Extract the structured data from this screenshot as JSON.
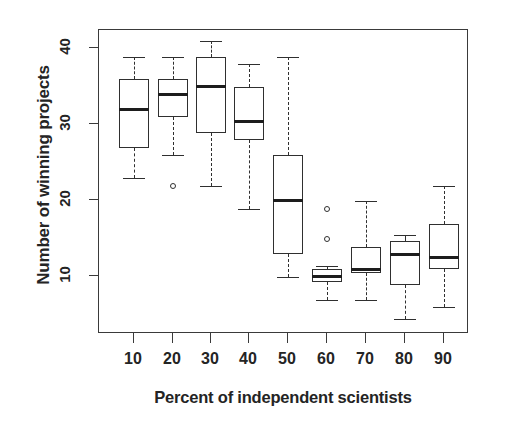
{
  "chart_data": {
    "type": "box",
    "title": "",
    "xlabel": "Percent of independent scientists",
    "ylabel": "Number of winning projects",
    "categories": [
      "10",
      "20",
      "30",
      "40",
      "50",
      "60",
      "70",
      "80",
      "90"
    ],
    "x_tick_labels": [
      "10",
      "20",
      "30",
      "40",
      "50",
      "60",
      "70",
      "80",
      "90"
    ],
    "y_tick_labels": [
      "10",
      "20",
      "30",
      "40"
    ],
    "y_tick_values": [
      10,
      20,
      30,
      40
    ],
    "ylim": [
      2,
      43
    ],
    "grid": false,
    "legend": false,
    "boxes": [
      {
        "category": "10",
        "whisker_low": 23,
        "q1": 27,
        "median": 32,
        "q3": 36,
        "whisker_high": 39,
        "outliers": []
      },
      {
        "category": "20",
        "whisker_low": 26,
        "q1": 31,
        "median": 34,
        "q3": 36,
        "whisker_high": 39,
        "outliers": [
          22
        ]
      },
      {
        "category": "30",
        "whisker_low": 22,
        "q1": 29,
        "median": 35,
        "q3": 39,
        "whisker_high": 41,
        "outliers": []
      },
      {
        "category": "40",
        "whisker_low": 19,
        "q1": 28,
        "median": 30.5,
        "q3": 35,
        "whisker_high": 38,
        "outliers": []
      },
      {
        "category": "50",
        "whisker_low": 10,
        "q1": 13,
        "median": 20,
        "q3": 26,
        "whisker_high": 39,
        "outliers": []
      },
      {
        "category": "60",
        "whisker_low": 7,
        "q1": 9.3,
        "median": 10,
        "q3": 11,
        "whisker_high": 11.5,
        "outliers": [
          19,
          15
        ]
      },
      {
        "category": "70",
        "whisker_low": 7,
        "q1": 10.5,
        "median": 11,
        "q3": 14,
        "whisker_high": 20,
        "outliers": []
      },
      {
        "category": "80",
        "whisker_low": 4.5,
        "q1": 9,
        "median": 13,
        "q3": 14.7,
        "whisker_high": 15.5,
        "outliers": []
      },
      {
        "category": "90",
        "whisker_low": 6,
        "q1": 11,
        "median": 12.5,
        "q3": 17,
        "whisker_high": 22,
        "outliers": []
      }
    ],
    "colors": {
      "box_stroke": "#2f2f2f",
      "median_stroke": "#1d1d1d",
      "axis": "#3a3a3a",
      "background": "#ffffff",
      "text": "#242424"
    }
  }
}
